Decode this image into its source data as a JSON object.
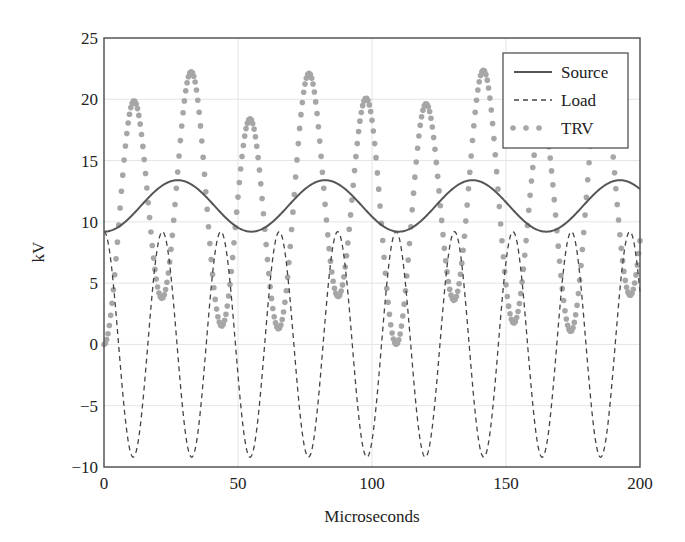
{
  "chart_data": {
    "type": "line",
    "title": "",
    "xlabel": "Microseconds",
    "ylabel": "kV",
    "xlim": [
      0,
      200
    ],
    "ylim": [
      -10,
      25
    ],
    "xticks": [
      0,
      50,
      100,
      150,
      200
    ],
    "xtick_labels": [
      "0",
      "50",
      "100",
      "150",
      "200"
    ],
    "yticks": [
      -10,
      -5,
      0,
      5,
      10,
      15,
      20,
      25
    ],
    "ytick_labels": [
      "−10",
      "−5",
      "0",
      "5",
      "10",
      "15",
      "20",
      "25"
    ],
    "grid": true,
    "legend_position": "upper right",
    "sample_step_us": 0.5,
    "series": [
      {
        "name": "Source",
        "style": "solid",
        "color": "#555555",
        "model": {
          "form": "offset - amp*cos(2*pi*t/period)",
          "offset": 11.3,
          "amp": 2.1,
          "period": 55.0
        },
        "key_points": [
          [
            0,
            9.2
          ],
          [
            27.5,
            13.4
          ],
          [
            55,
            9.2
          ],
          [
            82.5,
            13.4
          ],
          [
            110,
            9.2
          ],
          [
            137.5,
            13.4
          ],
          [
            165,
            9.2
          ],
          [
            192.5,
            13.4
          ],
          [
            200,
            12.5
          ]
        ]
      },
      {
        "name": "Load",
        "style": "dashed",
        "color": "#444444",
        "model": {
          "form": "amp*cos(2*pi*t/period)",
          "amp": 9.2,
          "period": 21.8
        },
        "key_points": [
          [
            0,
            9.2
          ],
          [
            10.9,
            -9.2
          ],
          [
            21.8,
            9.2
          ],
          [
            32.7,
            -9.2
          ],
          [
            43.6,
            9.2
          ],
          [
            54.5,
            -9.2
          ],
          [
            65.4,
            9.2
          ],
          [
            76.3,
            -9.2
          ],
          [
            87.2,
            9.2
          ],
          [
            98.1,
            -9.2
          ],
          [
            109,
            9.2
          ],
          [
            119.9,
            -9.2
          ],
          [
            130.8,
            9.2
          ],
          [
            141.7,
            -9.2
          ],
          [
            152.6,
            9.2
          ],
          [
            163.5,
            -9.2
          ],
          [
            174.4,
            9.2
          ],
          [
            185.3,
            -9.2
          ],
          [
            196.2,
            9.2
          ]
        ]
      },
      {
        "name": "TRV",
        "style": "dotted-markers",
        "color": "#a6a6a6",
        "model": {
          "form": "Source - Load"
        },
        "key_points": [
          [
            0,
            0
          ],
          [
            10.9,
            19.9
          ],
          [
            32.7,
            22.3
          ],
          [
            54.5,
            18.4
          ],
          [
            76.3,
            21.9
          ],
          [
            98.1,
            19.8
          ],
          [
            119.9,
            19.4
          ],
          [
            141.7,
            21.7
          ],
          [
            163.5,
            18.4
          ],
          [
            185.3,
            22.1
          ]
        ]
      }
    ]
  },
  "legend": {
    "items": [
      {
        "label": "Source"
      },
      {
        "label": "Load"
      },
      {
        "label": "TRV"
      }
    ]
  },
  "axes": {
    "xlabel": "Microseconds",
    "ylabel": "kV"
  }
}
